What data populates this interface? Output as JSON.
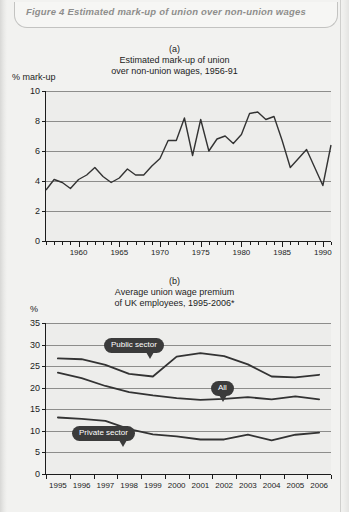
{
  "figure": {
    "caption": "Figure 4  Estimated mark-up of union over non-union wages"
  },
  "chart_data": [
    {
      "type": "line",
      "panel": "(a)",
      "title_line1": "Estimated mark-up of union",
      "title_line2": "over non-union wages, 1956-91",
      "ylabel": "% mark-up",
      "xlabel": "",
      "ylim": [
        0,
        10
      ],
      "yticks": [
        0,
        2,
        4,
        6,
        8,
        10
      ],
      "ytick_labels": [
        "0",
        "2",
        "4",
        "6",
        "8",
        "10"
      ],
      "xlim": [
        1956,
        1991
      ],
      "xticks": [
        1960,
        1965,
        1970,
        1975,
        1980,
        1985,
        1990
      ],
      "xtick_labels": [
        "1960",
        "1965",
        "1970",
        "1975",
        "1980",
        "1985",
        "1990"
      ],
      "grid": true,
      "legend": "none",
      "x": [
        1956,
        1957,
        1958,
        1959,
        1960,
        1961,
        1962,
        1963,
        1964,
        1965,
        1966,
        1967,
        1968,
        1969,
        1970,
        1971,
        1972,
        1973,
        1974,
        1975,
        1976,
        1977,
        1978,
        1979,
        1980,
        1981,
        1982,
        1983,
        1984,
        1985,
        1986,
        1987,
        1988,
        1989,
        1990,
        1991
      ],
      "values": [
        3.4,
        4.1,
        3.9,
        3.5,
        4.1,
        4.4,
        4.9,
        4.3,
        3.9,
        4.2,
        4.8,
        4.4,
        4.4,
        5.0,
        5.5,
        6.7,
        6.7,
        8.2,
        5.7,
        8.1,
        6.0,
        6.8,
        7.0,
        6.5,
        7.1,
        8.5,
        8.6,
        8.1,
        8.3,
        6.7,
        4.9,
        5.5,
        6.1,
        4.9,
        3.7,
        6.4
      ]
    },
    {
      "type": "line",
      "panel": "(b)",
      "title_line1": "Average union wage premium",
      "title_line2": "of UK employees, 1995-2006*",
      "ylabel": "%",
      "xlabel": "",
      "ylim": [
        0,
        35
      ],
      "yticks": [
        0,
        5,
        10,
        15,
        20,
        25,
        30,
        35
      ],
      "ytick_labels": [
        "0",
        "5",
        "10",
        "15",
        "20",
        "25",
        "30",
        "35"
      ],
      "grid": true,
      "legend": "callouts",
      "categories": [
        "1995",
        "1996",
        "1997",
        "1998",
        "1999",
        "2000",
        "2001",
        "2002",
        "2003",
        "2004",
        "2005",
        "2006"
      ],
      "series": [
        {
          "name": "Public sector",
          "values": [
            26.8,
            26.6,
            25.3,
            23.2,
            22.6,
            27.2,
            28.0,
            27.3,
            25.4,
            22.6,
            22.4,
            23.0
          ]
        },
        {
          "name": "All",
          "values": [
            23.5,
            22.2,
            20.4,
            19.0,
            18.2,
            17.6,
            17.2,
            17.4,
            17.8,
            17.3,
            18.0,
            17.3
          ]
        },
        {
          "name": "Private sector",
          "values": [
            13.1,
            12.8,
            12.3,
            10.4,
            9.2,
            8.7,
            8.0,
            8.0,
            9.1,
            7.8,
            9.1,
            9.6
          ]
        }
      ],
      "callouts": [
        {
          "label": "Public sector"
        },
        {
          "label": "All"
        },
        {
          "label": "Private sector"
        }
      ]
    }
  ],
  "colors": {
    "page_background": "#f2f2f0",
    "plot_background": "#ededeb",
    "line": "#333333",
    "gridline": "#8d8d8b",
    "callout_background": "#3b3b3b",
    "callout_text": "#ffffff",
    "caption_text": "#8e8e8c",
    "axis_text": "#1c1c1c"
  }
}
